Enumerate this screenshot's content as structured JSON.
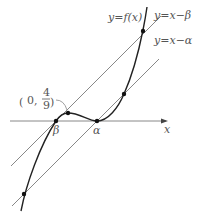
{
  "diagram": {
    "axis": {
      "x_label": "x"
    },
    "curve": {
      "label": "y=f(x)"
    },
    "line_beta": {
      "label": "y=x−β"
    },
    "line_alpha": {
      "label": "y=x−α"
    },
    "points": {
      "beta": "β",
      "alpha": "α",
      "intercept_open": "(",
      "intercept_zero": "0,",
      "intercept_num": "4",
      "intercept_den": "9",
      "intercept_close": ")"
    },
    "colors": {
      "curve": "#222222",
      "lines": "#888888",
      "axis": "#888888",
      "text": "#555555"
    }
  }
}
